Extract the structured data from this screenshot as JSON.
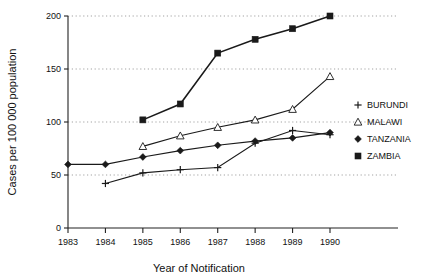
{
  "chart_data": {
    "type": "line",
    "title": "",
    "xlabel": "Year of Notification",
    "ylabel": "Cases per 100 000 population",
    "x": [
      1983,
      1984,
      1985,
      1986,
      1987,
      1988,
      1989,
      1990
    ],
    "xticklabels": [
      "1983",
      "1984",
      "1985",
      "1986",
      "1987",
      "1988",
      "1989",
      "1990"
    ],
    "yticklabels": [
      "0",
      "50",
      "100",
      "150",
      "200"
    ],
    "yticks": [
      0,
      50,
      100,
      150,
      200
    ],
    "xlim": [
      1983,
      1990
    ],
    "ylim": [
      0,
      200
    ],
    "grid": "horizontal-dotted",
    "legend_position": "right",
    "series": [
      {
        "name": "BURUNDI",
        "marker": "plus-icon",
        "color": "#1a1a1a",
        "x": [
          1984,
          1985,
          1986,
          1987,
          1988,
          1989,
          1990
        ],
        "values": [
          42,
          52,
          55,
          57,
          80,
          92,
          88
        ]
      },
      {
        "name": "MALAWI",
        "marker": "open-triangle-icon",
        "color": "#1a1a1a",
        "x": [
          1985,
          1986,
          1987,
          1988,
          1989,
          1990
        ],
        "values": [
          77,
          87,
          95,
          102,
          112,
          143
        ]
      },
      {
        "name": "TANZANIA",
        "marker": "filled-diamond-icon",
        "color": "#1a1a1a",
        "x": [
          1983,
          1984,
          1985,
          1986,
          1987,
          1988,
          1989,
          1990
        ],
        "values": [
          60,
          60,
          67,
          73,
          78,
          82,
          85,
          90
        ]
      },
      {
        "name": "ZAMBIA",
        "marker": "filled-square-icon",
        "color": "#1a1a1a",
        "x": [
          1985,
          1986,
          1987,
          1988,
          1989,
          1990
        ],
        "values": [
          102,
          117,
          165,
          178,
          188,
          200
        ]
      }
    ]
  }
}
